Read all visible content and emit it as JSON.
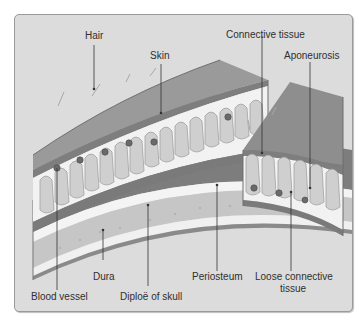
{
  "labels": {
    "hair": "Hair",
    "skin": "Skin",
    "connective_tissue": "Connective tissue",
    "aponeurosis": "Aponeurosis",
    "blood_vessel": "Blood vessel",
    "dura": "Dura",
    "diploe": "Diploë of skull",
    "periosteum": "Periosteum",
    "loose_connective_line1": "Loose connective",
    "loose_connective_line2": "tissue"
  },
  "colors": {
    "background": "#dcdcdc",
    "skin_surface": "#8e8e8e",
    "dermis": "#f2f2f2",
    "follicle": "#cfcfcf",
    "aponeurosis": "#7a7a7a",
    "loose_ct": "#ebebeb",
    "periosteum": "#7d7d7d",
    "bone_table": "#f4f4f4",
    "diploe": "#c6c6c6",
    "vessel": "#6a6a6a",
    "leader_line": "#333333"
  }
}
